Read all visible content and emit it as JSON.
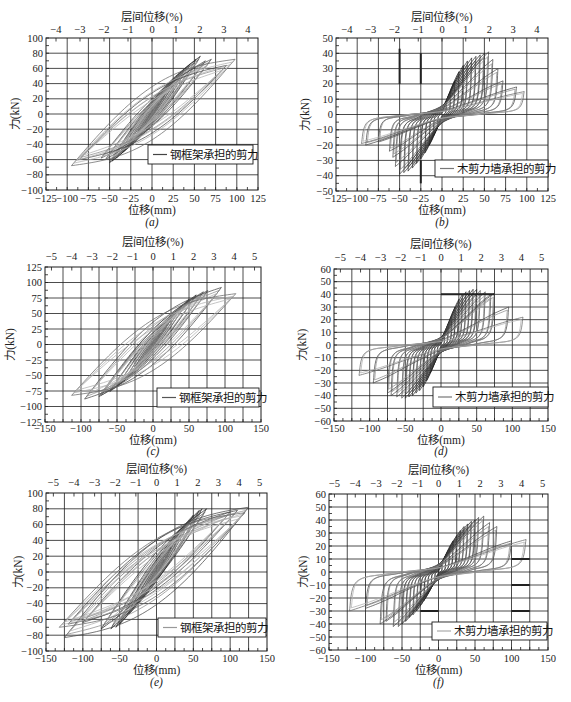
{
  "figure": {
    "panel_count": 6
  },
  "chart_data": [
    {
      "id": "a",
      "type": "line",
      "title": "",
      "caption": "(a)",
      "xlabel": "位移(mm)",
      "ylabel": "力(kN)",
      "top_xlabel": "层间位移(%)",
      "xlim": [
        -125,
        125
      ],
      "ylim": [
        -100,
        100
      ],
      "grid": true,
      "x_grid_step": 25,
      "x_ticks": [
        -125,
        -100,
        -75,
        -50,
        -25,
        0,
        25,
        50,
        75,
        100,
        125
      ],
      "x_tick_labels": [
        "−125",
        "−100",
        "−75",
        "−50",
        "−25",
        "0",
        "25",
        "50",
        "75",
        "100",
        "125"
      ],
      "y_ticks": [
        -100,
        -80,
        -60,
        -40,
        -20,
        0,
        20,
        40,
        60,
        80,
        100
      ],
      "y_tick_labels": [
        "−100",
        "−80",
        "−60",
        "−40",
        "−20",
        "0",
        "20",
        "40",
        "60",
        "80",
        "100"
      ],
      "top_ticks": [
        -4,
        -3,
        -2,
        -1,
        0,
        1,
        2,
        3,
        4
      ],
      "top_tick_labels": [
        "−4",
        "−3",
        "−2",
        "−1",
        "0",
        "1",
        "2",
        "3",
        "4"
      ],
      "mm_per_drift_pct": 28.3,
      "legend": {
        "label": "钢框架承担的剪力",
        "position": "lower right",
        "line_color": "#444444"
      },
      "highlight_segments": [],
      "series": [
        {
          "name": "钢框架承担的剪力",
          "kind": "steel",
          "loops_peak_xp_yp_xn_yn": [
            [
              8,
              14,
              -8,
              -12
            ],
            [
              15,
              26,
              -15,
              -24
            ],
            [
              22,
              38,
              -22,
              -34
            ],
            [
              30,
              48,
              -30,
              -44
            ],
            [
              38,
              58,
              -36,
              -52
            ],
            [
              45,
              66,
              -42,
              -58
            ],
            [
              52,
              72,
              -47,
              -62
            ],
            [
              57,
              76,
              -50,
              -64
            ],
            [
              63,
              70,
              -55,
              -60
            ],
            [
              70,
              72,
              -60,
              -58
            ],
            [
              88,
              64,
              -86,
              -60
            ],
            [
              98,
              72,
              -95,
              -68
            ]
          ]
        }
      ]
    },
    {
      "id": "b",
      "type": "line",
      "title": "",
      "caption": "(b)",
      "xlabel": "位移(mm)",
      "ylabel": "力(kN)",
      "top_xlabel": "层间位移(%)",
      "xlim": [
        -125,
        125
      ],
      "ylim": [
        -50,
        50
      ],
      "grid": true,
      "x_grid_step": 25,
      "x_ticks": [
        -125,
        -100,
        -75,
        -50,
        -25,
        0,
        25,
        50,
        75,
        100,
        125
      ],
      "x_tick_labels": [
        "−125",
        "−100",
        "−75",
        "−50",
        "−25",
        "0",
        "25",
        "50",
        "75",
        "100",
        "125"
      ],
      "y_ticks": [
        -50,
        -40,
        -30,
        -20,
        -10,
        0,
        10,
        20,
        30,
        40,
        50
      ],
      "y_tick_labels": [
        "−50",
        "−40",
        "−30",
        "−20",
        "−10",
        "0",
        "10",
        "20",
        "30",
        "40",
        "50"
      ],
      "top_ticks": [
        -4,
        -3,
        -2,
        -1,
        0,
        1,
        2,
        3,
        4
      ],
      "top_tick_labels": [
        "−4",
        "−3",
        "−2",
        "−1",
        "0",
        "1",
        "2",
        "3",
        "4"
      ],
      "mm_per_drift_pct": 28.0,
      "legend": {
        "label": "木剪力墙承担的剪力",
        "position": "lower right",
        "line_color": "#777777"
      },
      "highlight_segments": [
        {
          "x": [
            -50,
            -50
          ],
          "y": [
            20,
            43
          ]
        },
        {
          "x": [
            -25,
            -25
          ],
          "y": [
            20,
            40
          ]
        },
        {
          "x": [
            -25,
            -25
          ],
          "y": [
            -45,
            -30
          ]
        }
      ],
      "series": [
        {
          "name": "木剪力墙承担的剪力",
          "kind": "wood",
          "loops_peak_xp_yp_xn_yn": [
            [
              5,
              8,
              -5,
              -8
            ],
            [
              10,
              15,
              -10,
              -14
            ],
            [
              15,
              22,
              -15,
              -20
            ],
            [
              20,
              28,
              -20,
              -25
            ],
            [
              25,
              32,
              -25,
              -29
            ],
            [
              30,
              35,
              -30,
              -32
            ],
            [
              35,
              37,
              -35,
              -35
            ],
            [
              40,
              38,
              -40,
              -37
            ],
            [
              45,
              39,
              -45,
              -38
            ],
            [
              50,
              40,
              -50,
              -39
            ],
            [
              55,
              41,
              -55,
              -34
            ],
            [
              60,
              36,
              -58,
              -28
            ],
            [
              66,
              30,
              -62,
              -24
            ],
            [
              72,
              22,
              -75,
              -18
            ],
            [
              88,
              18,
              -90,
              -20
            ],
            [
              97,
              15,
              -95,
              -19
            ]
          ]
        }
      ]
    },
    {
      "id": "c",
      "type": "line",
      "title": "",
      "caption": "(c)",
      "xlabel": "位移(mm)",
      "ylabel": "力(kN)",
      "top_xlabel": "层间位移(%)",
      "xlim": [
        -150,
        150
      ],
      "ylim": [
        -125,
        125
      ],
      "grid": true,
      "x_grid_step": 25,
      "x_ticks": [
        -150,
        -100,
        -50,
        0,
        50,
        100,
        150
      ],
      "x_tick_labels": [
        "−150",
        "−100",
        "−50",
        "0",
        "50",
        "100",
        "150"
      ],
      "y_ticks": [
        -125,
        -100,
        -75,
        -50,
        -25,
        0,
        25,
        50,
        75,
        100,
        125
      ],
      "y_tick_labels": [
        "−125",
        "−100",
        "−75",
        "−50",
        "−25",
        "0",
        "25",
        "50",
        "75",
        "100",
        "125"
      ],
      "top_ticks": [
        -5,
        -4,
        -3,
        -2,
        -1,
        0,
        1,
        2,
        3,
        4,
        5
      ],
      "top_tick_labels": [
        "−5",
        "−4",
        "−3",
        "−2",
        "−1",
        "0",
        "1",
        "2",
        "3",
        "4",
        "5"
      ],
      "mm_per_drift_pct": 28.2,
      "legend": {
        "label": "钢框架承担的剪力",
        "position": "lower right",
        "line_color": "#555555"
      },
      "highlight_segments": [],
      "series": [
        {
          "name": "钢框架承担的剪力",
          "kind": "steel",
          "loops_peak_xp_yp_xn_yn": [
            [
              10,
              18,
              -10,
              -17
            ],
            [
              20,
              35,
              -20,
              -32
            ],
            [
              30,
              50,
              -30,
              -46
            ],
            [
              40,
              62,
              -40,
              -58
            ],
            [
              50,
              73,
              -50,
              -68
            ],
            [
              60,
              80,
              -60,
              -76
            ],
            [
              70,
              85,
              -72,
              -82
            ],
            [
              76,
              87,
              -75,
              -84
            ],
            [
              95,
              92,
              -95,
              -88
            ],
            [
              115,
              82,
              -113,
              -82
            ]
          ]
        }
      ]
    },
    {
      "id": "d",
      "type": "line",
      "title": "",
      "caption": "(d)",
      "xlabel": "位移(mm)",
      "ylabel": "力(kN)",
      "top_xlabel": "层间位移(%)",
      "xlim": [
        -150,
        150
      ],
      "ylim": [
        -60,
        60
      ],
      "grid": true,
      "x_grid_step": 25,
      "x_ticks": [
        -150,
        -100,
        -50,
        0,
        50,
        100,
        150
      ],
      "x_tick_labels": [
        "−150",
        "−100",
        "−50",
        "0",
        "50",
        "100",
        "150"
      ],
      "y_ticks": [
        -60,
        -50,
        -40,
        -30,
        -20,
        -10,
        0,
        10,
        20,
        30,
        40,
        50,
        60
      ],
      "y_tick_labels": [
        "−60",
        "−50",
        "−40",
        "−30",
        "−20",
        "−10",
        "0",
        "10",
        "20",
        "30",
        "40",
        "50",
        "60"
      ],
      "top_ticks": [
        -5,
        -4,
        -3,
        -2,
        -1,
        0,
        1,
        2,
        3,
        4,
        5
      ],
      "top_tick_labels": [
        "−5",
        "−4",
        "−3",
        "−2",
        "−1",
        "0",
        "1",
        "2",
        "3",
        "4",
        "5"
      ],
      "mm_per_drift_pct": 28.2,
      "legend": {
        "label": "木剪力墙承担的剪力",
        "position": "lower right",
        "line_color": "#777777"
      },
      "highlight_segments": [
        {
          "x": [
            0,
            75
          ],
          "y": [
            40,
            40
          ]
        }
      ],
      "series": [
        {
          "name": "木剪力墙承担的剪力",
          "kind": "wood",
          "loops_peak_xp_yp_xn_yn": [
            [
              5,
              8,
              -5,
              -8
            ],
            [
              10,
              15,
              -10,
              -15
            ],
            [
              15,
              22,
              -15,
              -22
            ],
            [
              20,
              30,
              -20,
              -28
            ],
            [
              25,
              36,
              -25,
              -33
            ],
            [
              30,
              40,
              -30,
              -36
            ],
            [
              35,
              42,
              -35,
              -38
            ],
            [
              40,
              43,
              -40,
              -40
            ],
            [
              45,
              44,
              -45,
              -41
            ],
            [
              50,
              44,
              -50,
              -42
            ],
            [
              55,
              43,
              -55,
              -42
            ],
            [
              62,
              42,
              -62,
              -41
            ],
            [
              70,
              40,
              -70,
              -40
            ],
            [
              75,
              41,
              -75,
              -38
            ],
            [
              95,
              30,
              -95,
              -30
            ],
            [
              115,
              22,
              -115,
              -24
            ]
          ]
        }
      ]
    },
    {
      "id": "e",
      "type": "line",
      "title": "",
      "caption": "(e)",
      "xlabel": "位移(mm)",
      "ylabel": "力(kN)",
      "top_xlabel": "层间位移(%)",
      "xlim": [
        -150,
        150
      ],
      "ylim": [
        -100,
        100
      ],
      "grid": true,
      "x_grid_step": 25,
      "x_ticks": [
        -150,
        -100,
        -50,
        0,
        50,
        100,
        150
      ],
      "x_tick_labels": [
        "−150",
        "−100",
        "−50",
        "0",
        "50",
        "100",
        "150"
      ],
      "y_ticks": [
        -100,
        -80,
        -60,
        -40,
        -20,
        0,
        20,
        40,
        60,
        80,
        100
      ],
      "y_tick_labels": [
        "−100",
        "−80",
        "−60",
        "−40",
        "−20",
        "0",
        "20",
        "40",
        "60",
        "80",
        "100"
      ],
      "top_ticks": [
        -5,
        -4,
        -3,
        -2,
        -1,
        0,
        1,
        2,
        3,
        4,
        5
      ],
      "top_tick_labels": [
        "−5",
        "−4",
        "−3",
        "−2",
        "−1",
        "0",
        "1",
        "2",
        "3",
        "4",
        "5"
      ],
      "mm_per_drift_pct": 28.0,
      "legend": {
        "label": "钢框架承担的剪力",
        "position": "lower right",
        "line_color": "#999999"
      },
      "highlight_segments": [],
      "series": [
        {
          "name": "钢框架承担的剪力",
          "kind": "steel",
          "loops_peak_xp_yp_xn_yn": [
            [
              10,
              16,
              -10,
              -15
            ],
            [
              20,
              32,
              -20,
              -30
            ],
            [
              30,
              48,
              -30,
              -44
            ],
            [
              40,
              60,
              -40,
              -55
            ],
            [
              50,
              72,
              -50,
              -66
            ],
            [
              58,
              78,
              -55,
              -70
            ],
            [
              62,
              80,
              -62,
              -72
            ],
            [
              68,
              80,
              -75,
              -72
            ],
            [
              100,
              76,
              -100,
              -64
            ],
            [
              110,
              78,
              -120,
              -66
            ],
            [
              125,
              82,
              -125,
              -83
            ],
            [
              120,
              75,
              -132,
              -70
            ]
          ]
        }
      ]
    },
    {
      "id": "f",
      "type": "line",
      "title": "",
      "caption": "(f)",
      "xlabel": "位移(mm)",
      "ylabel": "力(kN)",
      "top_xlabel": "层间位移(%)",
      "xlim": [
        -150,
        150
      ],
      "ylim": [
        -60,
        60
      ],
      "grid": true,
      "x_grid_step": 25,
      "x_ticks": [
        -150,
        -100,
        -50,
        0,
        50,
        100,
        150
      ],
      "x_tick_labels": [
        "−150",
        "−100",
        "−50",
        "0",
        "50",
        "100",
        "150"
      ],
      "y_ticks": [
        -60,
        -50,
        -40,
        -30,
        -20,
        -10,
        0,
        10,
        20,
        30,
        40,
        50,
        60
      ],
      "y_tick_labels": [
        "−60",
        "−50",
        "−40",
        "−30",
        "−20",
        "−10",
        "0",
        "10",
        "20",
        "30",
        "40",
        "50",
        "60"
      ],
      "top_ticks": [
        -5,
        -4,
        -3,
        -2,
        -1,
        0,
        1,
        2,
        3,
        4,
        5
      ],
      "top_tick_labels": [
        "−5",
        "−4",
        "−3",
        "−2",
        "−1",
        "0",
        "1",
        "2",
        "3",
        "4",
        "5"
      ],
      "mm_per_drift_pct": 28.5,
      "legend": {
        "label": "木剪力墙承担的剪力",
        "position": "lower right",
        "line_color": "#aaaaaa"
      },
      "highlight_segments": [
        {
          "x": [
            100,
            125
          ],
          "y": [
            -10,
            -10
          ]
        },
        {
          "x": [
            100,
            125
          ],
          "y": [
            -30,
            -30
          ]
        },
        {
          "x": [
            -25,
            0
          ],
          "y": [
            -30,
            -30
          ]
        },
        {
          "x": [
            100,
            125
          ],
          "y": [
            10,
            10
          ]
        }
      ],
      "series": [
        {
          "name": "木剪力墙承担的剪力",
          "kind": "wood",
          "loops_peak_xp_yp_xn_yn": [
            [
              5,
              6,
              -5,
              -6
            ],
            [
              10,
              12,
              -10,
              -12
            ],
            [
              15,
              18,
              -15,
              -17
            ],
            [
              20,
              24,
              -20,
              -22
            ],
            [
              25,
              28,
              -25,
              -26
            ],
            [
              30,
              32,
              -30,
              -30
            ],
            [
              35,
              35,
              -35,
              -33
            ],
            [
              40,
              37,
              -40,
              -35
            ],
            [
              45,
              39,
              -45,
              -38
            ],
            [
              50,
              40,
              -50,
              -40
            ],
            [
              55,
              42,
              -55,
              -42
            ],
            [
              62,
              43,
              -62,
              -42
            ],
            [
              70,
              38,
              -72,
              -38
            ],
            [
              80,
              35,
              -80,
              -40
            ],
            [
              100,
              24,
              -100,
              -28
            ],
            [
              120,
              25,
              -122,
              -30
            ]
          ]
        }
      ]
    }
  ]
}
